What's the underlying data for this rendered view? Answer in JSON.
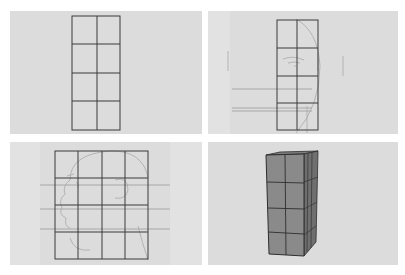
{
  "figure": {
    "background_color": "#ffffff",
    "panel_color": "#dcdcdc",
    "grid_line_color": "#3a3a3a",
    "sketch_line_color": "#a8a8a8",
    "guide_line_color": "#9a9a9a",
    "box_front_color": "#8a8a8a",
    "box_side_color": "#6f6f6f",
    "box_top_color": "#7c7c7c",
    "panels": [
      {
        "id": "grid-2x4",
        "columns": 2,
        "rows": 4,
        "label": ""
      },
      {
        "id": "grid-on-front-face",
        "columns": 2,
        "rows": 4,
        "label": ""
      },
      {
        "id": "grid-on-profile-head",
        "columns": 4,
        "rows": 4,
        "label": ""
      },
      {
        "id": "extruded-3d-grid",
        "columns": 2,
        "rows": 4,
        "label": ""
      }
    ]
  }
}
